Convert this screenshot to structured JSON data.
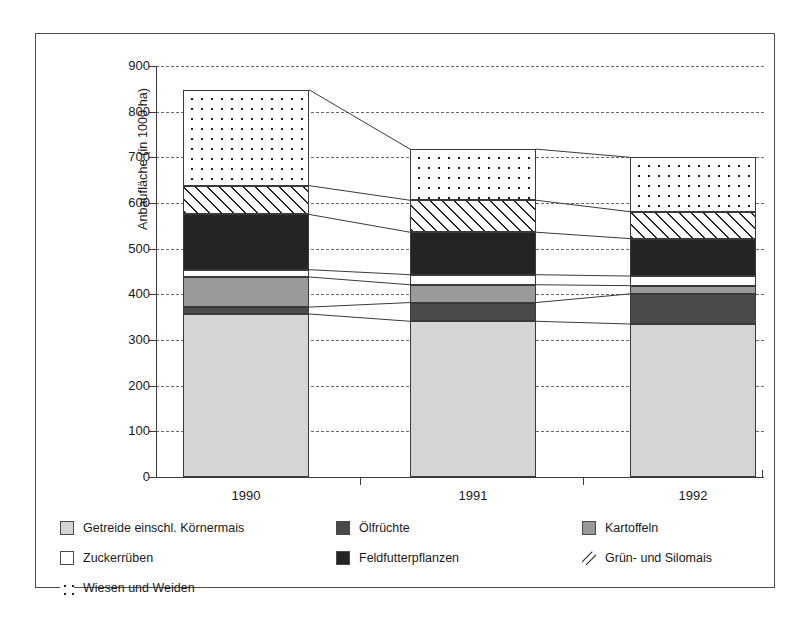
{
  "chart_data": {
    "type": "bar",
    "title": "",
    "subtitle": "",
    "xlabel": "",
    "ylabel": "Anbaufläche (in 1000 ha)",
    "categories": [
      "1990",
      "1991",
      "1992"
    ],
    "ylim": [
      0,
      900
    ],
    "yticks": [
      0,
      100,
      200,
      300,
      400,
      500,
      600,
      700,
      800,
      900
    ],
    "ytick_labels": [
      "0",
      "100",
      "200",
      "300",
      "400",
      "500",
      "600",
      "700",
      "800",
      "900"
    ],
    "grid": true,
    "stacked": true,
    "legend_position": "bottom",
    "series": [
      {
        "name": "Getreide einschl.  Körnermais",
        "key": "getreide",
        "color": "#d5d5d5",
        "pattern": "solid",
        "values": [
          357,
          341,
          335
        ]
      },
      {
        "name": "Ölfrüchte",
        "key": "oelfruechte",
        "color": "#4a4a4a",
        "pattern": "solid",
        "values": [
          15,
          41,
          66
        ]
      },
      {
        "name": "Kartoffeln",
        "key": "kartoffeln",
        "color": "#9a9a9a",
        "pattern": "solid",
        "values": [
          66,
          39,
          18
        ]
      },
      {
        "name": "Zuckerrüben",
        "key": "zuckerrueben",
        "color": "#ffffff",
        "pattern": "solid",
        "values": [
          16,
          22,
          21
        ]
      },
      {
        "name": "Feldfutterpflanzen",
        "key": "feldfutter",
        "color": "#242424",
        "pattern": "solid",
        "values": [
          121,
          93,
          82
        ]
      },
      {
        "name": "Grün- und Silomais",
        "key": "gruenmais",
        "color": "#ffffff",
        "pattern": "diagonal-hatch",
        "values": [
          63,
          70,
          59
        ]
      },
      {
        "name": "Wiesen und Weiden",
        "key": "wiesen",
        "color": "#ffffff",
        "pattern": "dots",
        "values": [
          210,
          112,
          119
        ]
      }
    ],
    "totals": [
      848,
      718,
      700
    ]
  },
  "chart": {
    "ylabel": "Anbaufläche (in 1000 ha)",
    "ytick_labels": {
      "t900": "900",
      "t800": "800",
      "t700": "700",
      "t600": "600",
      "t500": "500",
      "t400": "400",
      "t300": "300",
      "t200": "200",
      "t100": "100",
      "t0": "0"
    },
    "xtick_labels": {
      "x1990": "1990",
      "x1991": "1991",
      "x1992": "1992"
    }
  },
  "legend": {
    "items": [
      {
        "label": "Getreide einschl.  Körnermais",
        "swatch": "swatch-light-gray"
      },
      {
        "label": "Ölfrüchte",
        "swatch": "swatch-dark-gray"
      },
      {
        "label": "Kartoffeln",
        "swatch": "swatch-medium-gray"
      },
      {
        "label": "Zuckerrüben",
        "swatch": "swatch-white"
      },
      {
        "label": "Feldfutterpflanzen",
        "swatch": "swatch-black"
      },
      {
        "label": "Grün- und Silomais",
        "swatch": "swatch-diagonal-hatch"
      },
      {
        "label": "Wiesen und Weiden",
        "swatch": "swatch-dots"
      }
    ]
  }
}
